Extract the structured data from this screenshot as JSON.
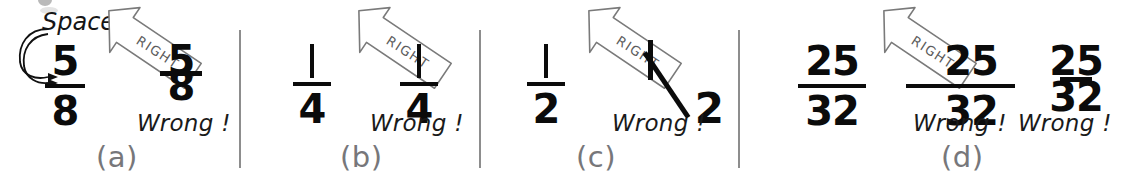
{
  "figure": {
    "background_color": "#ffffff",
    "ink_color": "#0b0b0b",
    "divider_color": "#8d8d8d",
    "label_color": "#77777a",
    "arrow_text_color": "#5c5c5c"
  },
  "callout": {
    "spaces_label": "Spaces"
  },
  "arrow": {
    "label": "RIGHT"
  },
  "annotations": {
    "wrong_label": "Wrong !"
  },
  "panels": [
    {
      "letter": "(a)",
      "correct": {
        "numerator": "5",
        "denominator": "8"
      },
      "wrong": [
        {
          "numerator": "5",
          "denominator": "8",
          "note": "Wrong !"
        }
      ]
    },
    {
      "letter": "(b)",
      "correct": {
        "numerator": "1",
        "denominator": "4"
      },
      "wrong": [
        {
          "numerator": "1",
          "denominator": "4",
          "note": "Wrong !"
        }
      ]
    },
    {
      "letter": "(c)",
      "correct": {
        "numerator": "1",
        "denominator": "2"
      },
      "wrong": [
        {
          "numerator": "1",
          "denominator": "2",
          "note": "Wrong !"
        }
      ]
    },
    {
      "letter": "(d)",
      "correct": {
        "numerator": "25",
        "denominator": "32"
      },
      "wrong": [
        {
          "numerator": "25",
          "denominator": "32",
          "note": "Wrong !"
        },
        {
          "numerator": "25",
          "denominator": "32",
          "note": "Wrong !"
        }
      ]
    }
  ]
}
